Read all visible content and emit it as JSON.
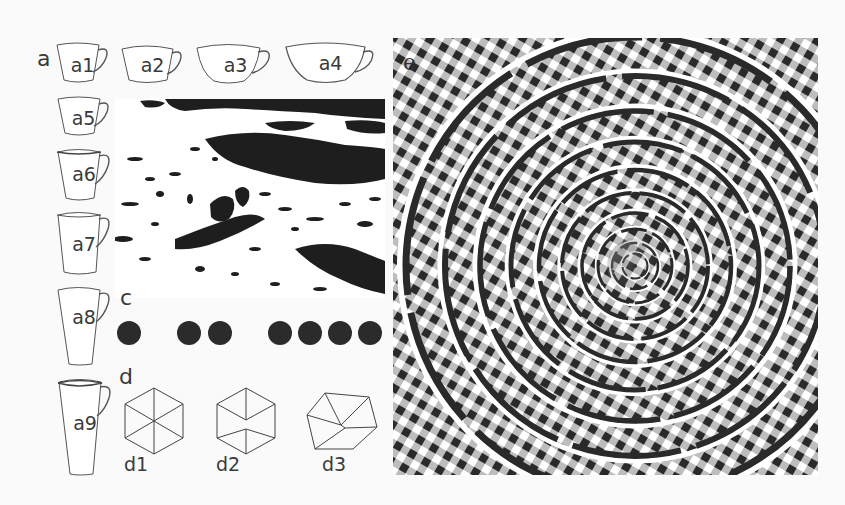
{
  "figure": {
    "panels": {
      "a": {
        "label": "a",
        "cups": [
          {
            "id": "a1",
            "label": "a1"
          },
          {
            "id": "a2",
            "label": "a2"
          },
          {
            "id": "a3",
            "label": "a3"
          },
          {
            "id": "a4",
            "label": "a4"
          },
          {
            "id": "a5",
            "label": "a5"
          },
          {
            "id": "a6",
            "label": "a6"
          },
          {
            "id": "a7",
            "label": "a7"
          },
          {
            "id": "a8",
            "label": "a8"
          },
          {
            "id": "a9",
            "label": "a9"
          }
        ]
      },
      "b": {
        "label": "b",
        "content": "high-contrast black and white photograph (hidden dalmatian)"
      },
      "c": {
        "label": "c",
        "dot_groups": [
          1,
          2,
          4
        ],
        "dot_color": "#2b2b2b"
      },
      "d": {
        "label": "d",
        "shapes": [
          {
            "id": "d1",
            "label": "d1",
            "type": "hexagon-with-diagonals"
          },
          {
            "id": "d2",
            "label": "d2",
            "type": "cube"
          },
          {
            "id": "d3",
            "label": "d3",
            "type": "rotated-cube"
          }
        ]
      },
      "e": {
        "label": "e",
        "content": "Fraser spiral illusion",
        "colors": {
          "dark": "#2a2a2a",
          "gray": "#bdbdbd",
          "light": "#ffffff"
        }
      }
    }
  }
}
